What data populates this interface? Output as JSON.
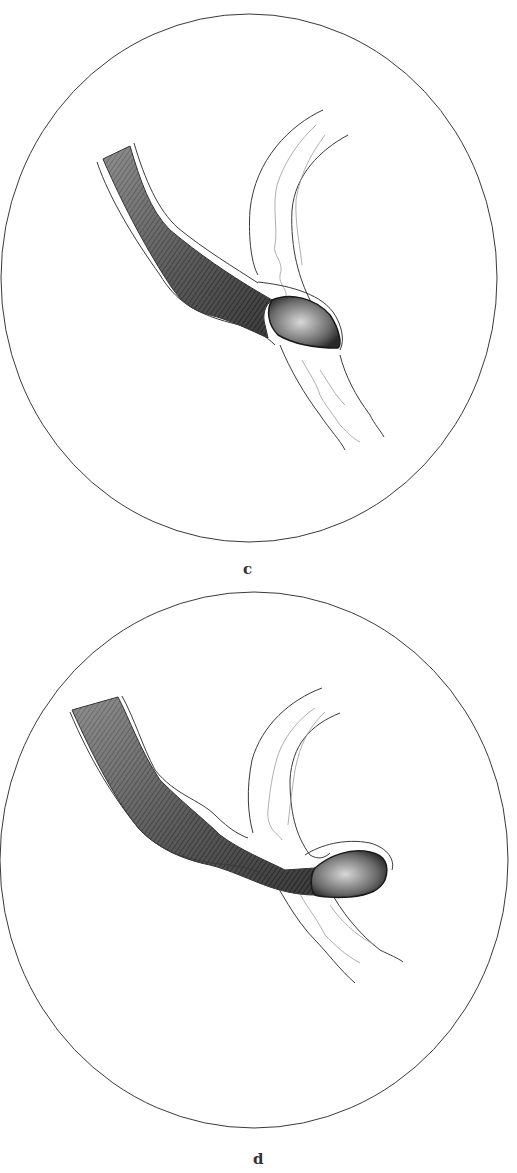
{
  "figure": {
    "panels": [
      {
        "id": "c",
        "label": "c"
      },
      {
        "id": "d",
        "label": "d"
      }
    ],
    "colors": {
      "ink": "#2a2a2a",
      "light_ink": "#8a8a8a",
      "paper": "#ffffff"
    }
  }
}
